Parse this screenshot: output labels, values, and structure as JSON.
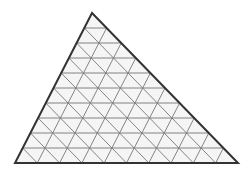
{
  "figure": {
    "type": "geometric-diagram",
    "canvas": {
      "width": 251,
      "height": 174,
      "background": "#ffffff"
    },
    "shape": {
      "name": "triangle",
      "vertices": {
        "apex": {
          "x": 92,
          "y": 13
        },
        "bottom_left": {
          "x": 15,
          "y": 163
        },
        "bottom_right": {
          "x": 238,
          "y": 163
        }
      },
      "subdivisions": 10,
      "fill": "#f5f5f5",
      "outline_color": "#333333",
      "outline_width": 2,
      "grid_color": "#777777",
      "grid_width": 0.9
    },
    "counts": {
      "rows": 10,
      "upward_triangles": 100,
      "downward_triangles": 81,
      "small_triangles_total": 100,
      "bottom_row_cells": 10
    },
    "labels": {
      "caption": ""
    }
  }
}
